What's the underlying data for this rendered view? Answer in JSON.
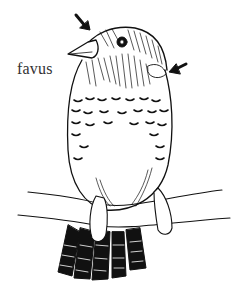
{
  "figure": {
    "label": "favus",
    "annotations": [
      {
        "type": "arrow",
        "target": "beak-base-lesion"
      },
      {
        "type": "arrow",
        "target": "ear-region-lesion"
      }
    ]
  }
}
